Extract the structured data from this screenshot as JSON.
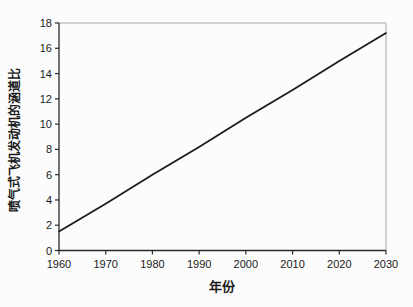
{
  "figure": {
    "background": "#fcfcfc"
  },
  "chart_data": {
    "type": "line",
    "title": "",
    "xlabel": "年份",
    "ylabel": "喷气式飞机发动机的涵道比",
    "xlim": [
      1960,
      2030
    ],
    "ylim": [
      0,
      18
    ],
    "x_ticks": [
      1960,
      1970,
      1980,
      1990,
      2000,
      2010,
      2020,
      2030
    ],
    "y_ticks": [
      0,
      2,
      4,
      6,
      8,
      10,
      12,
      14,
      16,
      18
    ],
    "grid": false,
    "legend_position": "none",
    "series": [
      {
        "x": [
          1960,
          1970,
          1980,
          1990,
          2000,
          2010,
          2020,
          2030
        ],
        "y": [
          1.5,
          3.7,
          6.0,
          8.2,
          10.5,
          12.7,
          15.0,
          17.2
        ]
      }
    ],
    "colors": {
      "line": "#1c1c1c",
      "axis": "#2a2a2a",
      "frame": "#a8a8a8",
      "text": "#1a1a1a"
    }
  }
}
